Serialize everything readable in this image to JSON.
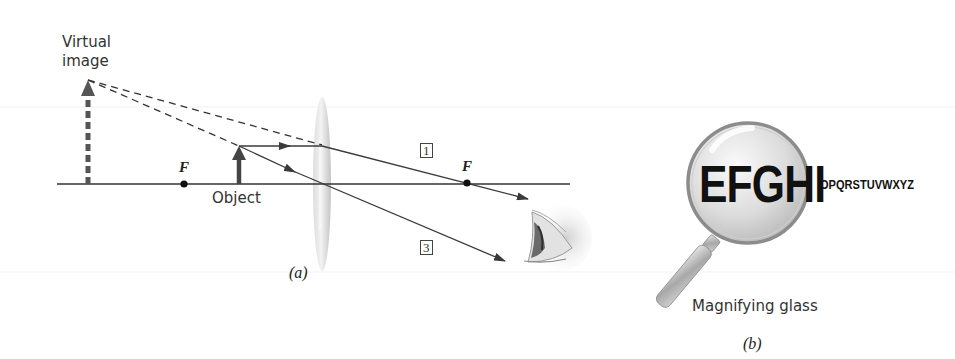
{
  "panel_a": {
    "caption": "(a)",
    "labels": {
      "virtual_image_line1": "Virtual",
      "virtual_image_line2": "image",
      "object": "Object",
      "focal_left": "F",
      "focal_right": "F",
      "ray_1": "1",
      "ray_3": "3"
    },
    "colors": {
      "ray": "#3a3a3a",
      "arrow": "#444444",
      "lens": "#c8c8c8"
    }
  },
  "panel_b": {
    "caption": "(b)",
    "magnified_text": "EFGHI",
    "normal_text": "OPQRSTUVWXYZ",
    "label": "Magnifying glass"
  }
}
